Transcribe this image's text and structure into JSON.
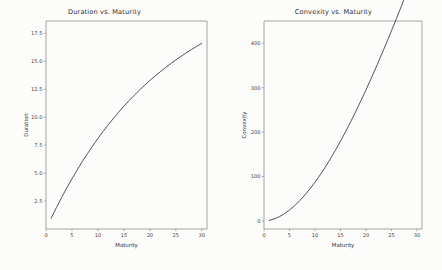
{
  "figure": {
    "background_color": "#fcfcfb",
    "width": 442,
    "height": 270
  },
  "charts": [
    {
      "id": "duration-chart",
      "title": "Duration vs. Maturity",
      "xlabel": "Maturity",
      "ylabel": "Duration",
      "xticks": [
        "0",
        "5",
        "10",
        "15",
        "20",
        "25",
        "30"
      ],
      "yticks": [
        "2.5",
        "5.0",
        "7.5",
        "10.0",
        "12.5",
        "15.0",
        "17.5"
      ]
    },
    {
      "id": "convexity-chart",
      "title": "Convexity vs. Maturity",
      "xlabel": "Maturity",
      "ylabel": "Convexity",
      "xticks": [
        "0",
        "5",
        "10",
        "15",
        "20",
        "25",
        "30"
      ],
      "yticks": [
        "0",
        "100",
        "200",
        "300",
        "400"
      ]
    }
  ],
  "chart_data": [
    {
      "type": "line",
      "title": "Duration vs. Maturity",
      "xlabel": "Maturity",
      "ylabel": "Duration",
      "xlim": [
        0,
        31
      ],
      "ylim": [
        0.0,
        18.6
      ],
      "xticks": [
        0,
        5,
        10,
        15,
        20,
        25,
        30
      ],
      "yticks": [
        2.5,
        5.0,
        7.5,
        10.0,
        12.5,
        15.0,
        17.5
      ],
      "grid": false,
      "legend": false,
      "line_color": "#4a4a52",
      "series": [
        {
          "name": "Duration",
          "x": [
            1,
            2,
            3,
            4,
            5,
            6,
            7,
            8,
            9,
            10,
            11,
            12,
            13,
            14,
            15,
            16,
            17,
            18,
            19,
            20,
            21,
            22,
            23,
            24,
            25,
            26,
            27,
            28,
            29,
            30
          ],
          "values": [
            0.97,
            1.91,
            2.81,
            3.67,
            4.49,
            5.28,
            6.03,
            6.75,
            7.44,
            8.1,
            8.73,
            9.33,
            9.9,
            10.45,
            10.98,
            11.48,
            11.96,
            12.42,
            12.86,
            13.28,
            13.68,
            14.06,
            14.43,
            14.78,
            15.12,
            15.44,
            15.75,
            16.05,
            16.33,
            16.6
          ]
        }
      ]
    },
    {
      "type": "line",
      "title": "Convexity vs. Maturity",
      "xlabel": "Maturity",
      "ylabel": "Convexity",
      "xlim": [
        0,
        31
      ],
      "ylim": [
        -18,
        450
      ],
      "xticks": [
        0,
        5,
        10,
        15,
        20,
        25,
        30
      ],
      "yticks": [
        0,
        100,
        200,
        300,
        400
      ],
      "grid": false,
      "legend": false,
      "line_color": "#4a4a52",
      "series": [
        {
          "name": "Convexity",
          "x": [
            1,
            2,
            3,
            4,
            5,
            6,
            7,
            8,
            9,
            10,
            11,
            12,
            13,
            14,
            15,
            16,
            17,
            18,
            19,
            20,
            21,
            22,
            23,
            24,
            25,
            26,
            27,
            28,
            29,
            30
          ],
          "values": [
            1.3,
            4.6,
            9.6,
            16.3,
            24.6,
            34.4,
            45.6,
            58.2,
            72.1,
            87.2,
            103.5,
            120.9,
            139.4,
            158.9,
            179.4,
            200.8,
            223.1,
            246.2,
            270.1,
            294.7,
            320.1,
            346.1,
            372.7,
            399.9,
            427.7,
            456.0,
            484.8,
            514.0,
            543.7,
            573.8
          ]
        }
      ]
    }
  ]
}
